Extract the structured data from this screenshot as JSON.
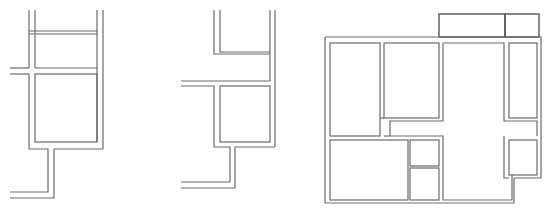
{
  "figure": {
    "line_color": "#6a6a6a",
    "background": "#ffffff",
    "panels": [
      {
        "id": "plan-a",
        "label": "",
        "rooms": 2,
        "features": [
          "double-line walls",
          "corridor opening left",
          "stepped stem wall"
        ]
      },
      {
        "id": "plan-b",
        "label": "",
        "rooms": 2,
        "features": [
          "double-line walls",
          "corridor opening left",
          "stepped stem wall"
        ]
      },
      {
        "id": "plan-c",
        "label": "",
        "rooms": 11,
        "features": [
          "outer envelope",
          "top annex rooms",
          "central corridor",
          "small service rooms"
        ]
      }
    ]
  }
}
